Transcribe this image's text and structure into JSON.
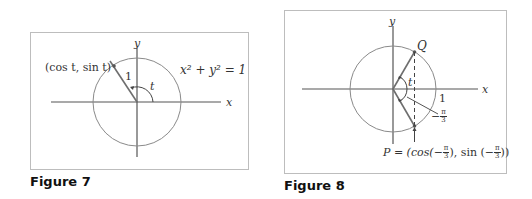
{
  "figures": [
    {
      "caption": "Figure 7",
      "axis_labels": {
        "x": "x",
        "y": "y"
      },
      "point_label": "(cos t, sin t)",
      "radius_label": "1",
      "angle_label": "t",
      "equation": "x² + y² = 1"
    },
    {
      "caption": "Figure 8",
      "axis_labels": {
        "x": "x",
        "y": "y"
      },
      "point_Q_label": "Q",
      "angle_label": "t",
      "radius_label": "1",
      "neg_angle": {
        "sign": "−",
        "num": "π",
        "den": "3"
      },
      "point_P": {
        "prefix": "P = (cos(",
        "mid": "), sin (",
        "suffix": "))",
        "frac_sign": "−",
        "frac_num": "π",
        "frac_den": "3"
      }
    }
  ],
  "colors": {
    "axis": "#555555",
    "circle": "#8a8a8a",
    "radius_line": "#6e6e6e",
    "frame": "#bdbdbd",
    "text": "#333333"
  }
}
